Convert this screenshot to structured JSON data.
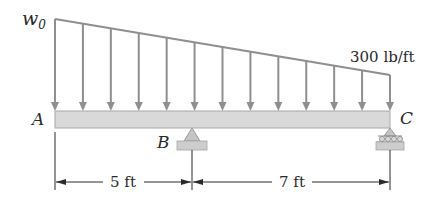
{
  "figure": {
    "type": "beam-loading-diagram",
    "load": {
      "left_label": "w",
      "left_subscript": "0",
      "right_label": "300 lb/ft",
      "arrow_count": 13,
      "distribution": "linearly varying (trapezoidal), decreasing from left to right"
    },
    "points": {
      "A": "A",
      "B": "B",
      "C": "C"
    },
    "supports": {
      "B": "pin",
      "C": "roller"
    },
    "dimensions": [
      {
        "label": "5 ft",
        "from": "A",
        "to": "B"
      },
      {
        "label": "7 ft",
        "from": "B",
        "to": "C"
      }
    ]
  },
  "colors": {
    "load": "#8f8f8f",
    "beam_fill": "#d9d9d9",
    "beam_edge": "#a8a8a8",
    "ground": "#c8c8c8",
    "ink": "#2a2a2a"
  }
}
